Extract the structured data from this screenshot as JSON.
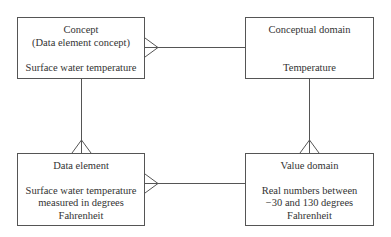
{
  "diagram": {
    "type": "entity-relationship (crow's foot notation)",
    "entities": [
      {
        "id": "concept",
        "title": "Concept",
        "subtitle": "(Data element concept)",
        "value": "Surface water temperature"
      },
      {
        "id": "conceptual_domain",
        "title": "Conceptual domain",
        "value": "Temperature"
      },
      {
        "id": "data_element",
        "title": "Data element",
        "value_lines": [
          "Surface water temperature",
          "measured in degrees",
          "Fahrenheit"
        ]
      },
      {
        "id": "value_domain",
        "title": "Value domain",
        "value_lines": [
          "Real numbers between",
          "−30 and 130 degrees",
          "Fahrenheit"
        ]
      }
    ],
    "relationships": [
      {
        "from": "conceptual_domain",
        "to": "concept",
        "many_end": "concept"
      },
      {
        "from": "concept",
        "to": "data_element",
        "many_end": "data_element"
      },
      {
        "from": "value_domain",
        "to": "data_element",
        "many_end": "data_element"
      },
      {
        "from": "conceptual_domain",
        "to": "value_domain",
        "many_end": "value_domain"
      }
    ],
    "colors": {
      "line": "#555555",
      "text": "#333333",
      "background": "#ffffff"
    }
  }
}
